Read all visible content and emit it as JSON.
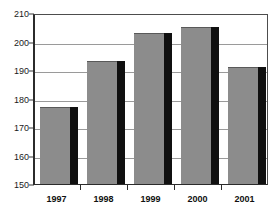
{
  "chart_data": {
    "type": "bar",
    "title": "",
    "subtitle": "",
    "xlabel": "",
    "ylabel": "",
    "categories": [
      "1997",
      "1998",
      "1999",
      "2000",
      "2001"
    ],
    "values": [
      177,
      193,
      203,
      205,
      191
    ],
    "ylim": [
      150,
      210
    ],
    "ytick_step": 10,
    "yticks": [
      150,
      160,
      170,
      180,
      190,
      200,
      210
    ],
    "ytick_labels": [
      "150",
      "160",
      "170",
      "180",
      "190",
      "200",
      "210"
    ],
    "grid": true,
    "grid_axis": "y",
    "legend": false,
    "legend_entries": [],
    "annotations": [],
    "series": [
      {
        "name": "Series 1",
        "values": [
          177,
          193,
          203,
          205,
          191
        ]
      }
    ]
  },
  "style": {
    "bar_fill": "#8c8c8c",
    "bar_shadow": "#101010",
    "bar_top_edge": "#595959",
    "gridline_color": "#9a9a9a",
    "axis_color": "#2b2b2b",
    "frame_color": "#4d4d4d",
    "label_color": "#101010",
    "background": "#ffffff"
  }
}
